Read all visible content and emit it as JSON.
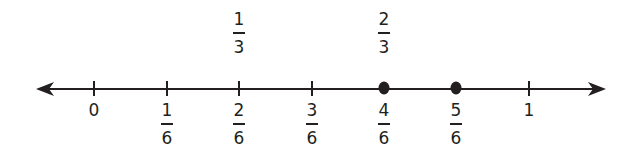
{
  "diagram": {
    "type": "number-line",
    "range": [
      0,
      1
    ],
    "color": "#231f20",
    "ticks": [
      {
        "value": 0,
        "x": 94,
        "label": "0",
        "kind": "whole"
      },
      {
        "value": 0.1667,
        "x": 167,
        "num": "1",
        "den": "6",
        "kind": "fraction"
      },
      {
        "value": 0.3333,
        "x": 239,
        "num": "2",
        "den": "6",
        "kind": "fraction"
      },
      {
        "value": 0.5,
        "x": 312,
        "num": "3",
        "den": "6",
        "kind": "fraction"
      },
      {
        "value": 0.6667,
        "x": 384,
        "num": "4",
        "den": "6",
        "kind": "fraction"
      },
      {
        "value": 0.8333,
        "x": 456,
        "num": "5",
        "den": "6",
        "kind": "fraction"
      },
      {
        "value": 1,
        "x": 529,
        "label": "1",
        "kind": "whole"
      }
    ],
    "upper_labels": [
      {
        "x": 239,
        "num": "1",
        "den": "3"
      },
      {
        "x": 384,
        "num": "2",
        "den": "3"
      }
    ],
    "points": [
      {
        "x": 384,
        "value": "4/6"
      },
      {
        "x": 456,
        "value": "5/6"
      }
    ]
  }
}
